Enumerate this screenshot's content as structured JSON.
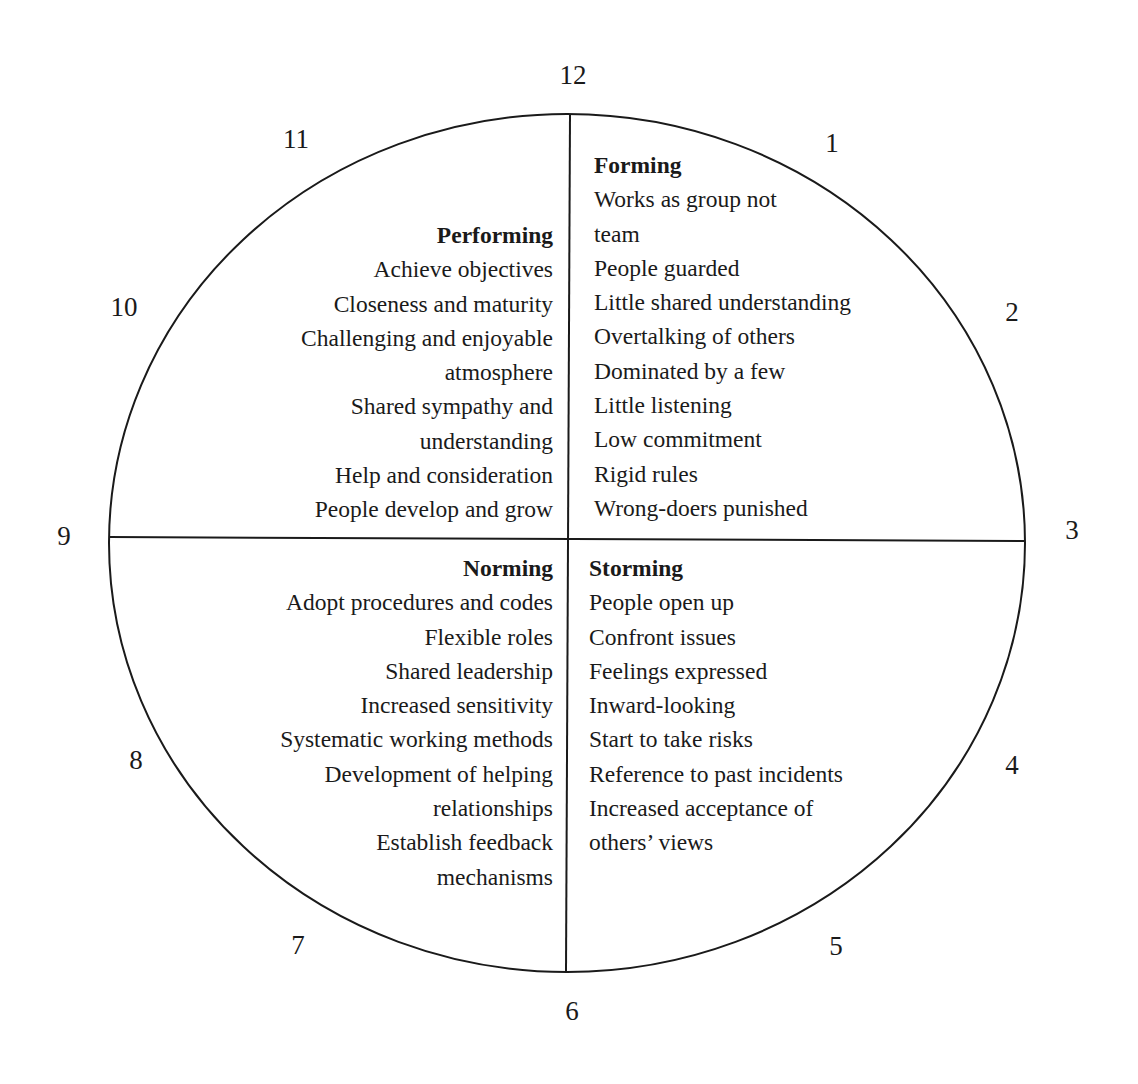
{
  "clock_numbers": [
    {
      "label": "12",
      "x": 573,
      "y": 75
    },
    {
      "label": "1",
      "x": 832,
      "y": 143
    },
    {
      "label": "2",
      "x": 1012,
      "y": 312
    },
    {
      "label": "3",
      "x": 1072,
      "y": 530
    },
    {
      "label": "4",
      "x": 1012,
      "y": 765
    },
    {
      "label": "5",
      "x": 836,
      "y": 946
    },
    {
      "label": "6",
      "x": 572,
      "y": 1011
    },
    {
      "label": "7",
      "x": 298,
      "y": 945
    },
    {
      "label": "8",
      "x": 136,
      "y": 760
    },
    {
      "label": "9",
      "x": 64,
      "y": 536
    },
    {
      "label": "10",
      "x": 124,
      "y": 307
    },
    {
      "label": "11",
      "x": 296,
      "y": 139
    }
  ],
  "quadrants": {
    "forming": {
      "title": "Forming",
      "items": [
        "Works as group not",
        "team",
        "People guarded",
        "Little shared understanding",
        "Overtalking of others",
        "Dominated by a few",
        "Little listening",
        "Low commitment",
        "Rigid rules",
        "Wrong-doers punished"
      ]
    },
    "storming": {
      "title": "Storming",
      "items": [
        "People open up",
        "Confront issues",
        "Feelings expressed",
        "Inward-looking",
        "Start to take risks",
        "Reference to past incidents",
        "Increased acceptance of",
        "others’ views"
      ]
    },
    "norming": {
      "title": "Norming",
      "items": [
        "Adopt procedures and codes",
        "Flexible roles",
        "Shared leadership",
        "Increased sensitivity",
        "Systematic working methods",
        "Development of helping",
        "relationships",
        "Establish feedback",
        "mechanisms"
      ]
    },
    "performing": {
      "title": "Performing",
      "items": [
        "Achieve objectives",
        "Closeness and maturity",
        "Challenging and enjoyable",
        "atmosphere",
        "Shared sympathy and",
        "understanding",
        "Help and consideration",
        "People develop and grow"
      ]
    }
  }
}
